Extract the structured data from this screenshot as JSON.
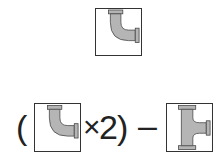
{
  "top": {
    "tile": {
      "piece": "elbow-fitting",
      "label": "elbow pipe fitting"
    }
  },
  "equation": {
    "open_paren": "(",
    "left_tile": {
      "piece": "elbow-fitting",
      "label": "elbow pipe fitting"
    },
    "multiply": "×",
    "factor": "2",
    "close_paren": ")",
    "minus": "–",
    "right_tile": {
      "piece": "tee-fitting",
      "label": "tee pipe fitting"
    }
  },
  "colors": {
    "pipe_fill": "#b5b5b5",
    "pipe_stroke": "#444444",
    "tile_border": "#333333",
    "background": "#ffffff"
  }
}
